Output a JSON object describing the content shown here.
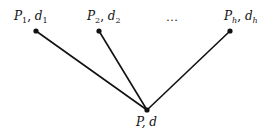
{
  "diagram": {
    "type": "tree",
    "colors": {
      "line": "#111111",
      "node": "#111111",
      "background": "#ffffff"
    },
    "top_nodes": [
      {
        "id": "n1",
        "label_main": "P",
        "label_sub": "1",
        "sep": ", ",
        "label_main2": "d",
        "label_sub2": "1",
        "x": 36,
        "y": 31
      },
      {
        "id": "n2",
        "label_main": "P",
        "label_sub": "2",
        "sep": ", ",
        "label_main2": "d",
        "label_sub2": "2",
        "x": 99,
        "y": 31
      },
      {
        "id": "nh",
        "label_main": "P",
        "label_sub": "h",
        "sep": ", ",
        "label_main2": "d",
        "label_sub2": "h",
        "x": 230,
        "y": 31
      }
    ],
    "ellipsis": "…",
    "root": {
      "id": "root",
      "label": "P, d",
      "x": 147,
      "y": 110
    },
    "edges": [
      {
        "from": "n1",
        "to": "root"
      },
      {
        "from": "n2",
        "to": "root"
      },
      {
        "from": "nh",
        "to": "root"
      }
    ]
  }
}
